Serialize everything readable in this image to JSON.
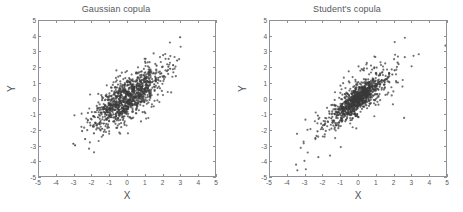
{
  "figure": {
    "background": "#ffffff",
    "point_color": "#3a3a3a",
    "axis_color": "#8d9196",
    "text_color": "#55585c"
  },
  "panels": [
    {
      "id": "gaussian",
      "title": "Gaussian copula",
      "xlabel": "X",
      "ylabel": "Y"
    },
    {
      "id": "students",
      "title": "Student's copula",
      "xlabel": "X",
      "ylabel": "Y"
    }
  ],
  "ticks": {
    "x": [
      "-5",
      "-4",
      "-3",
      "-2",
      "-1",
      "0",
      "1",
      "2",
      "3",
      "4",
      "5"
    ],
    "y": [
      "-5",
      "-4",
      "-3",
      "-2",
      "-1",
      "0",
      "1",
      "2",
      "3",
      "4",
      "5"
    ]
  },
  "chart_data": [
    {
      "type": "scatter",
      "title": "Gaussian copula",
      "xlabel": "X",
      "ylabel": "Y",
      "xlim": [
        -5,
        5
      ],
      "ylim": [
        -5,
        5
      ],
      "xticks": [
        -5,
        -4,
        -3,
        -2,
        -1,
        0,
        1,
        2,
        3,
        4,
        5
      ],
      "yticks": [
        -5,
        -4,
        -3,
        -2,
        -1,
        0,
        1,
        2,
        3,
        4,
        5
      ],
      "grid": false,
      "legend": null,
      "marker": "dot",
      "marker_size": 1.1,
      "color": "#3a3a3a",
      "n_points": 1000,
      "distribution": {
        "family": "gaussian-copula",
        "correlation": 0.72,
        "mean": [
          0,
          0
        ],
        "sd": [
          1.0,
          1.0
        ],
        "tail": "light"
      },
      "points": [
        [
          0.12,
          0.31
        ],
        [
          -0.45,
          -0.22
        ],
        [
          0.88,
          0.95
        ],
        [
          1.42,
          1.05
        ],
        [
          -1.12,
          -0.88
        ],
        [
          0.33,
          -0.14
        ],
        [
          -0.77,
          -1.02
        ],
        [
          1.95,
          1.62
        ],
        [
          -2.08,
          -1.73
        ],
        [
          0.54,
          0.88
        ],
        [
          2.35,
          2.05
        ],
        [
          -0.31,
          0.21
        ],
        [
          1.1,
          0.42
        ],
        [
          -1.65,
          -1.21
        ],
        [
          0.07,
          -0.55
        ],
        [
          0.71,
          1.24
        ],
        [
          -0.92,
          -0.35
        ],
        [
          1.78,
          1.34
        ],
        [
          -2.55,
          -2.1
        ],
        [
          0.25,
          0.62
        ],
        [
          3.02,
          3.95
        ],
        [
          -3.05,
          -2.92
        ],
        [
          2.62,
          2.15
        ],
        [
          -0.18,
          -0.72
        ],
        [
          1.33,
          1.86
        ],
        [
          -1.41,
          -1.95
        ],
        [
          0.46,
          0.05
        ],
        [
          0.95,
          0.33
        ],
        [
          -0.63,
          -1.15
        ],
        [
          2.1,
          1.45
        ],
        [
          -2.22,
          -1.4
        ],
        [
          0.82,
          1.52
        ],
        [
          -0.05,
          0.44
        ],
        [
          1.55,
          0.92
        ],
        [
          -1.88,
          -2.25
        ],
        [
          0.64,
          -0.33
        ],
        [
          -0.38,
          -0.95
        ],
        [
          2.85,
          2.45
        ],
        [
          -2.95,
          -3.02
        ],
        [
          0.19,
          1.03
        ],
        [
          1.22,
          1.71
        ],
        [
          -1.05,
          -0.44
        ],
        [
          0.4,
          0.76
        ],
        [
          -0.55,
          0.12
        ],
        [
          1.68,
          2.12
        ],
        [
          -1.32,
          -1.62
        ],
        [
          0.03,
          -0.21
        ],
        [
          2.45,
          1.92
        ],
        [
          -2.38,
          -2.62
        ],
        [
          0.77,
          0.18
        ]
      ]
    },
    {
      "type": "scatter",
      "title": "Student's copula",
      "xlabel": "X",
      "ylabel": "Y",
      "xlim": [
        -5,
        5
      ],
      "ylim": [
        -5,
        5
      ],
      "xticks": [
        -5,
        -4,
        -3,
        -2,
        -1,
        0,
        1,
        2,
        3,
        4,
        5
      ],
      "yticks": [
        -5,
        -4,
        -3,
        -2,
        -1,
        0,
        1,
        2,
        3,
        4,
        5
      ],
      "grid": false,
      "legend": null,
      "marker": "dot",
      "marker_size": 1.1,
      "color": "#3a3a3a",
      "n_points": 1000,
      "distribution": {
        "family": "student-t-copula",
        "correlation": 0.78,
        "df": 4,
        "mean": [
          0,
          0
        ],
        "sd": [
          0.72,
          0.72
        ],
        "tail": "heavy"
      },
      "points": [
        [
          0.05,
          0.12
        ],
        [
          -0.22,
          -0.18
        ],
        [
          0.61,
          0.7
        ],
        [
          0.95,
          0.82
        ],
        [
          -0.81,
          -0.64
        ],
        [
          0.18,
          -0.07
        ],
        [
          -0.52,
          -0.71
        ],
        [
          1.35,
          1.18
        ],
        [
          -1.52,
          -1.28
        ],
        [
          0.38,
          0.6
        ],
        [
          1.78,
          1.62
        ],
        [
          -0.15,
          0.11
        ],
        [
          0.72,
          0.28
        ],
        [
          -1.15,
          -0.92
        ],
        [
          0.02,
          -0.35
        ],
        [
          0.48,
          0.88
        ],
        [
          -0.66,
          -0.24
        ],
        [
          1.22,
          0.96
        ],
        [
          -1.92,
          -1.7
        ],
        [
          0.14,
          0.41
        ],
        [
          2.25,
          2.32
        ],
        [
          -2.3,
          -2.12
        ],
        [
          1.95,
          1.55
        ],
        [
          -0.1,
          -0.48
        ],
        [
          0.88,
          1.25
        ],
        [
          -0.98,
          -1.38
        ],
        [
          0.31,
          0.02
        ],
        [
          0.66,
          0.22
        ],
        [
          -0.42,
          -0.8
        ],
        [
          1.52,
          1.05
        ],
        [
          -1.62,
          -0.98
        ],
        [
          0.55,
          1.02
        ],
        [
          -0.02,
          0.3
        ],
        [
          1.08,
          0.64
        ],
        [
          -1.3,
          -1.58
        ],
        [
          0.44,
          -0.22
        ],
        [
          -0.26,
          -0.66
        ],
        [
          2.08,
          1.82
        ],
        [
          -2.42,
          -2.55
        ],
        [
          0.12,
          0.72
        ],
        [
          0.84,
          1.2
        ],
        [
          -0.72,
          -0.3
        ],
        [
          0.27,
          0.52
        ],
        [
          -0.36,
          0.08
        ],
        [
          1.18,
          1.48
        ],
        [
          -0.9,
          -1.12
        ],
        [
          0.01,
          -0.14
        ],
        [
          1.72,
          1.35
        ],
        [
          -2.05,
          -1.88
        ],
        [
          0.52,
          0.12
        ]
      ]
    }
  ]
}
